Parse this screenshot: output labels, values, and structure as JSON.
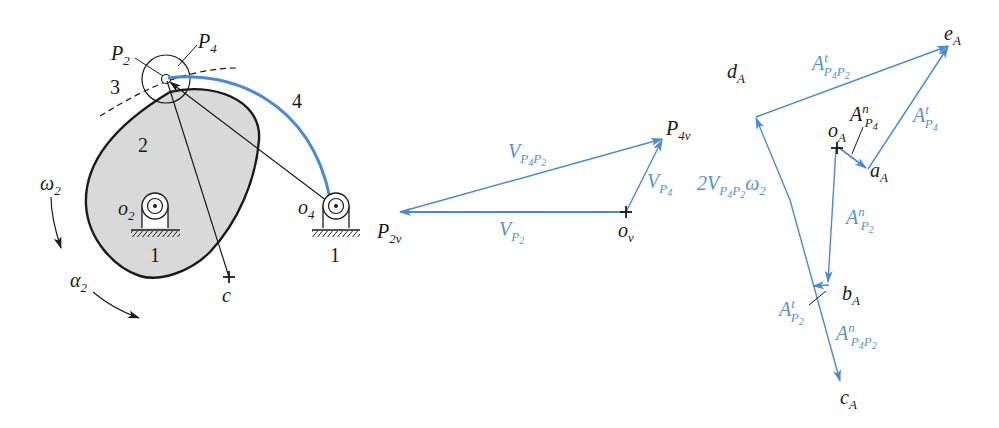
{
  "colors": {
    "vector_blue": "#4a8ad0",
    "label_blue": "#5b92c9",
    "cam_fill": "#d9d9d9",
    "ink": "#1a1a1a"
  },
  "mechanism": {
    "labels": {
      "P2": {
        "base": "P",
        "sub": "2"
      },
      "P4": {
        "base": "P",
        "sub": "4"
      },
      "link3": "3",
      "cam2": "2",
      "link4": "4",
      "ground_left": "1",
      "ground_right": "1",
      "o2": {
        "base": "o",
        "sub": "2"
      },
      "o4": {
        "base": "o",
        "sub": "4"
      },
      "c": "c",
      "omega2": {
        "base": "ω",
        "sub": "2"
      },
      "alpha2": {
        "base": "α",
        "sub": "2"
      }
    }
  },
  "velocity_polygon": {
    "points": {
      "ov": {
        "base": "o",
        "sub": "v"
      },
      "P2v": {
        "base": "P",
        "sub": "2v"
      },
      "P4v": {
        "base": "P",
        "sub": "4v"
      }
    },
    "vectors": {
      "VP4P2": {
        "base": "V",
        "sub1": "P",
        "sub1s": "4",
        "sub2": "P",
        "sub2s": "2"
      },
      "VP2": {
        "base": "V",
        "sub": "P",
        "subs": "2"
      },
      "VP4": {
        "base": "V",
        "sub": "P",
        "subs": "4"
      }
    }
  },
  "acceleration_polygon": {
    "points": {
      "oA": {
        "base": "o",
        "sub": "A"
      },
      "aA": {
        "base": "a",
        "sub": "A"
      },
      "bA": {
        "base": "b",
        "sub": "A"
      },
      "cA": {
        "base": "c",
        "sub": "A"
      },
      "dA": {
        "base": "d",
        "sub": "A"
      },
      "eA": {
        "base": "e",
        "sub": "A"
      }
    },
    "vectors": {
      "AtP4P2": {
        "base": "A",
        "sup": "t",
        "s1": "P",
        "s1s": "4",
        "s2": "P",
        "s2s": "2"
      },
      "AnP4": {
        "base": "A",
        "sup": "n",
        "s1": "P",
        "s1s": "4"
      },
      "AtP4": {
        "base": "A",
        "sup": "t",
        "s1": "P",
        "s1s": "4"
      },
      "AnP2": {
        "base": "A",
        "sup": "n",
        "s1": "P",
        "s1s": "2"
      },
      "AtP2": {
        "base": "A",
        "sup": "t",
        "s1": "P",
        "s1s": "2"
      },
      "AnP4P2": {
        "base": "A",
        "sup": "n",
        "s1": "P",
        "s1s": "4",
        "s2": "P",
        "s2s": "2"
      },
      "coriolis": {
        "coef": "2",
        "base": "V",
        "s1": "P",
        "s1s": "4",
        "s2": "P",
        "s2s": "2",
        "omega": "ω",
        "omega_sub": "2"
      }
    }
  }
}
